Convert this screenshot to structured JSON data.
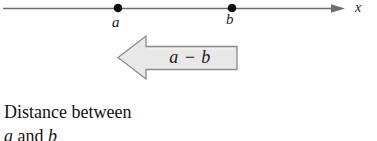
{
  "figure": {
    "background_color": "#ffffff"
  },
  "number_line": {
    "axis_label": "x",
    "line_color": "#6e6e6e",
    "point_color": "#000000",
    "points": [
      {
        "name": "a",
        "label": "a",
        "x_px": 118
      },
      {
        "name": "b",
        "label": "b",
        "x_px": 232
      }
    ],
    "arrowhead_tip_x_px": 345,
    "line_start_x_px": 3,
    "line_y_px": 8
  },
  "block_arrow": {
    "expression": "a − b",
    "direction": "left",
    "fill_color": "#e8e8e8",
    "border_color": "#8c8c8c",
    "tip_x_px": 118,
    "tail_x_px": 237,
    "top_y_px": 36,
    "bottom_y_px": 79
  },
  "caption": {
    "line1": "Distance between",
    "line2_prefix": "",
    "line2_var1": "a",
    "line2_mid": " and ",
    "line2_var2": "b",
    "line2_suffix": ""
  },
  "colors": {
    "text": "#111111",
    "line": "#6e6e6e",
    "arrow_fill": "#e8e8e8",
    "arrow_stroke": "#8c8c8c"
  }
}
